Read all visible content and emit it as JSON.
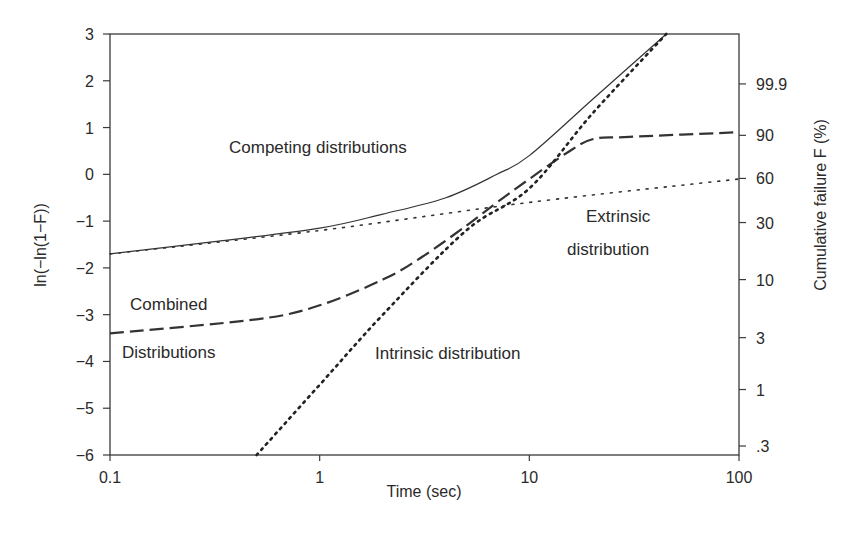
{
  "chart_data": {
    "type": "line",
    "title": "",
    "xlabel": "Time (sec)",
    "ylabel": "ln(−ln(1−F))",
    "y2label": "Cumulative failure F (%)",
    "xscale": "log",
    "xlim": [
      0.1,
      100
    ],
    "ylim": [
      -6,
      3
    ],
    "x_ticks": [
      "0.1",
      "1",
      "10",
      "100"
    ],
    "y_ticks": [
      "3",
      "2",
      "1",
      "0",
      "−1",
      "−2",
      "−3",
      "−4",
      "−5",
      "−6"
    ],
    "y2_ticks": [
      "99.9",
      "90",
      "60",
      "30",
      "10",
      "3",
      "1",
      ".3"
    ],
    "grid": false,
    "legend": null,
    "series": [
      {
        "name": "Competing distributions",
        "style": "solid",
        "x": [
          0.1,
          0.3,
          1,
          2,
          4,
          7,
          10,
          20,
          45
        ],
        "y": [
          -1.7,
          -1.45,
          -1.15,
          -0.85,
          -0.5,
          0.0,
          0.4,
          1.6,
          3.0
        ]
      },
      {
        "name": "Combined distributions",
        "style": "dashed",
        "x": [
          0.1,
          0.5,
          1,
          2,
          3,
          5,
          7,
          10,
          15,
          20,
          30,
          100
        ],
        "y": [
          -3.4,
          -3.1,
          -2.8,
          -2.25,
          -1.8,
          -1.1,
          -0.6,
          -0.1,
          0.45,
          0.75,
          0.8,
          0.9
        ]
      },
      {
        "name": "Intrinsic distribution",
        "style": "dotted",
        "x": [
          0.5,
          1,
          2,
          5,
          10,
          20,
          45
        ],
        "y": [
          -6.0,
          -4.5,
          -3.0,
          -1.2,
          -0.3,
          1.3,
          3.0
        ]
      },
      {
        "name": "Extrinsic distribution",
        "style": "fine-dotted",
        "x": [
          0.1,
          1,
          10,
          100
        ],
        "y": [
          -1.7,
          -1.2,
          -0.6,
          -0.1
        ]
      }
    ],
    "annotations": [
      "Competing distributions",
      "Combined",
      "Distributions",
      "Intrinsic distribution",
      "Extrinsic",
      "distribution"
    ]
  },
  "labels": {
    "xlabel": "Time (sec)",
    "ylabel": "ln(−ln(1−F))",
    "y2label": "Cumulative failure F (%)",
    "x_ticks": [
      "0.1",
      "1",
      "10",
      "100"
    ],
    "y_ticks": [
      "3",
      "2",
      "1",
      "0",
      "−1",
      "−2",
      "−3",
      "−4",
      "−5",
      "−6"
    ],
    "y2_ticks": [
      "99.9",
      "90",
      "60",
      "30",
      "10",
      "3",
      "1",
      ".3"
    ],
    "annot_competing": "Competing distributions",
    "annot_combined_1": "Combined",
    "annot_combined_2": "Distributions",
    "annot_intrinsic": "Intrinsic distribution",
    "annot_extrinsic_1": "Extrinsic",
    "annot_extrinsic_2": "distribution"
  }
}
